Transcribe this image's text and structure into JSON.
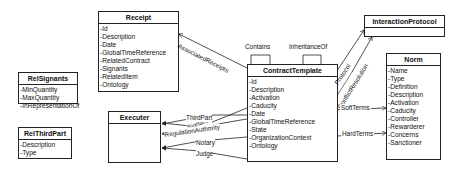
{
  "diagram": {
    "type": "UML class diagram",
    "classes": {
      "receipt": {
        "name": "Receipt",
        "attributes": [
          "Id",
          "Description",
          "Date",
          "GlobalTimeReference",
          "RelatedContract",
          "Signants",
          "RelatedItem",
          "Ontology"
        ]
      },
      "relsignants": {
        "name": "RelSignants",
        "attributes": [
          "MinQuantity",
          "MaxQuantity",
          "InRepresentationOf"
        ]
      },
      "relthirdpart": {
        "name": "RelThirdPart",
        "attributes": [
          "Description",
          "Type"
        ]
      },
      "executer": {
        "name": "Executer",
        "attributes": []
      },
      "contracttemplate": {
        "name": "ContractTemplate",
        "attributes": [
          "Id",
          "Description",
          "Activation",
          "Caducity",
          "Date",
          "GlobalTimeReference",
          "State",
          "OrganizationContext",
          "Ontology"
        ]
      },
      "interactionprotocol": {
        "name": "InteractionProtocol",
        "attributes": []
      },
      "norm": {
        "name": "Norm",
        "attributes": [
          "Name",
          "Type",
          "Definition",
          "Description",
          "Activation",
          "Caducity",
          "Controller",
          "Rewarderer",
          "Concerns",
          "Sanctioner"
        ]
      }
    },
    "relations": {
      "associated_receipts": "AssociatedReceipts",
      "contains": "Contains",
      "inheritance_of": "InheritanceOf",
      "protocol": "Protocol",
      "conflict_resolution": "ConflictResolution",
      "soft_terms": "SoftTerms",
      "hard_terms": "HardTerms",
      "signants": "Signants",
      "third_part": "ThirdPart",
      "regulation_authority": "RegulationAuthority",
      "notary": "Notary",
      "judge": "Judge"
    },
    "colors": {
      "line": "#222222",
      "background": "#ffffff"
    }
  }
}
